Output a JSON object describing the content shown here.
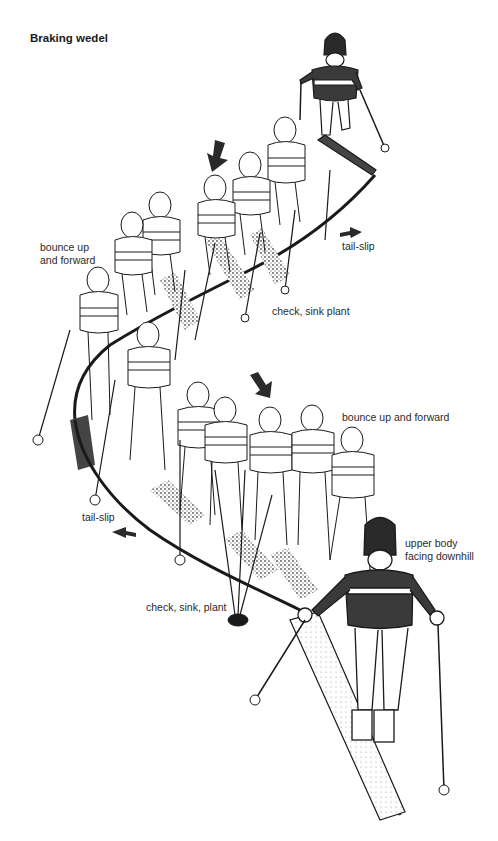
{
  "title": "Braking wedel",
  "labels": {
    "bounce_up_top_line1": "bounce up",
    "bounce_up_top_line2": "and forward",
    "tail_slip_top": "tail-slip",
    "check_sink_plant_top": "check, sink plant",
    "bounce_up_bottom": "bounce up and forward",
    "tail_slip_bottom": "tail-slip",
    "upper_body_line1": "upper body",
    "upper_body_line2": "facing downhill",
    "check_sink_plant_bottom": "check, sink, plant"
  },
  "colors": {
    "ink": "#1a1a1a",
    "sweater_dark": "#3a3a3a",
    "snow_shadow": "#555555",
    "paper": "#ffffff"
  }
}
